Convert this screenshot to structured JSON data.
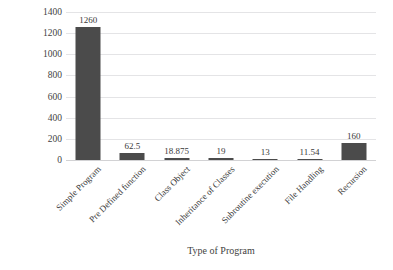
{
  "chart_data": {
    "type": "bar",
    "title": "",
    "xlabel": "Type of Program",
    "ylabel": "Performance Ratio",
    "categories": [
      "Simple Program",
      "Pre Defined function",
      "Class Object",
      "Inheritance of Classes",
      "Subroutine execution",
      "File Handling",
      "Recursion"
    ],
    "values": [
      1260,
      62.5,
      18.875,
      19,
      13,
      11.54,
      160
    ],
    "value_labels": [
      "1260",
      "62.5",
      "18.875",
      "19",
      "13",
      "11.54",
      "160"
    ],
    "ylim": [
      0,
      1400
    ],
    "yticks": [
      0,
      200,
      400,
      600,
      800,
      1000,
      1200,
      1400
    ],
    "ytick_labels": [
      "0",
      "200",
      "400",
      "600",
      "800",
      "1000",
      "1200",
      "1400"
    ],
    "grid": "horizontal",
    "legend": "none",
    "bar_color": "#4b4b4b",
    "gridline_color": "#e4e4e6",
    "background_color": "#ffffff",
    "xtick_rotation": -45
  }
}
